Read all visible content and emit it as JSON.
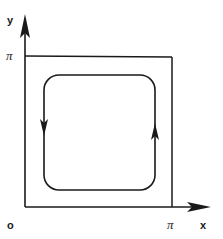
{
  "diagram": {
    "type": "phase-portrait",
    "axes": {
      "x_label": "x",
      "y_label": "y",
      "origin_label": "o",
      "x_tick_label": "π",
      "y_tick_label": "π"
    },
    "outer_square": {
      "x_range": [
        "0",
        "π"
      ],
      "y_range": [
        "0",
        "π"
      ]
    },
    "closed_orbit": {
      "shape": "rounded-rectangle",
      "direction": "counterclockwise",
      "arrows": [
        {
          "side": "left",
          "direction": "down"
        },
        {
          "side": "right",
          "direction": "up"
        }
      ]
    },
    "colors": {
      "ink": "#1a1a1a",
      "background": "#ffffff"
    }
  }
}
